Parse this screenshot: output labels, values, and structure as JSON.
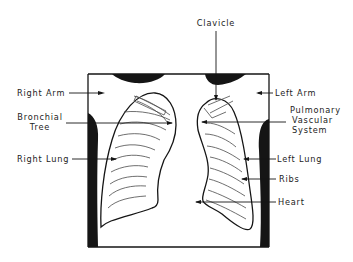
{
  "diagram": {
    "colors": {
      "ink": "#151515",
      "background": "#ffffff",
      "rib_lines": "#4a4a4a"
    },
    "labels": {
      "clavicle": "Clavicle",
      "right_arm": "Right Arm",
      "left_arm": "Left Arm",
      "bronchial_tree_line1": "Bronchial",
      "bronchial_tree_line2": "Tree",
      "pulmonary_line1": "Pulmonary",
      "pulmonary_line2": "Vascular",
      "pulmonary_line3": "System",
      "right_lung": "Right Lung",
      "left_lung": "Left Lung",
      "ribs": "Ribs",
      "heart": "Heart"
    }
  }
}
